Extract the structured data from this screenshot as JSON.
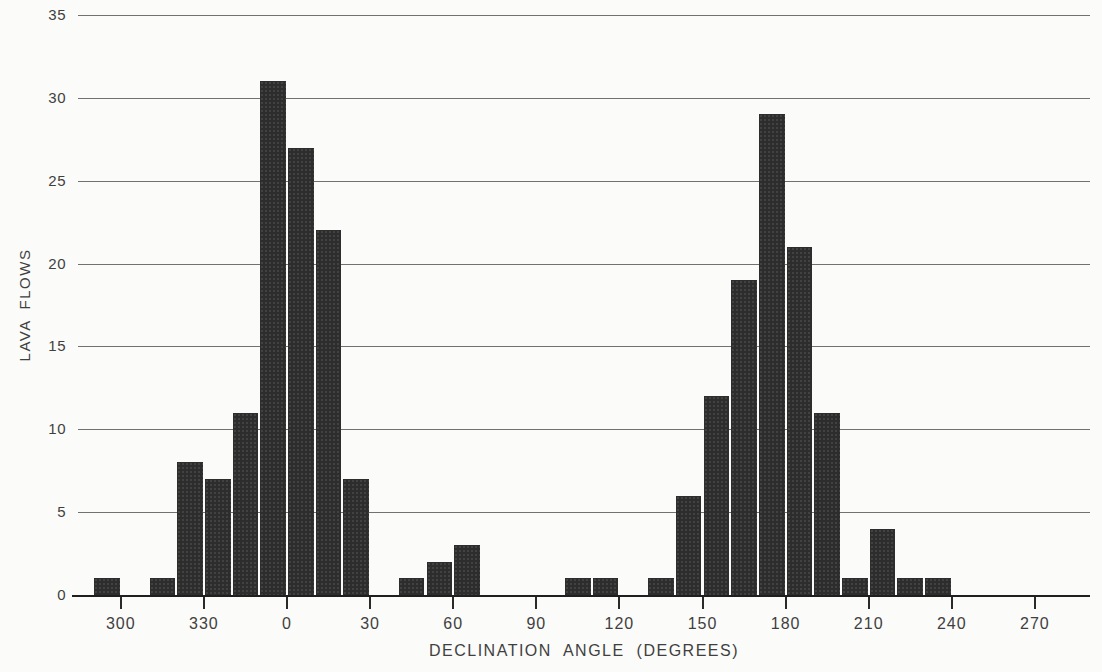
{
  "chart_data": {
    "type": "bar",
    "title": "",
    "xlabel": "DECLINATION ANGLE (DEGREES)",
    "ylabel": "LAVA FLOWS",
    "ylim": [
      0,
      35
    ],
    "y_ticks": [
      0,
      5,
      10,
      15,
      20,
      25,
      30,
      35
    ],
    "x_tick_labels": [
      "300",
      "330",
      "0",
      "30",
      "60",
      "90",
      "120",
      "150",
      "180",
      "210",
      "240",
      "270"
    ],
    "bin_width_deg": 10,
    "bins": [
      {
        "start_deg": 290,
        "count": 1
      },
      {
        "start_deg": 310,
        "count": 1
      },
      {
        "start_deg": 320,
        "count": 8
      },
      {
        "start_deg": 330,
        "count": 7
      },
      {
        "start_deg": 340,
        "count": 11
      },
      {
        "start_deg": 350,
        "count": 31
      },
      {
        "start_deg": 0,
        "count": 27
      },
      {
        "start_deg": 10,
        "count": 22
      },
      {
        "start_deg": 20,
        "count": 7
      },
      {
        "start_deg": 40,
        "count": 1
      },
      {
        "start_deg": 50,
        "count": 2
      },
      {
        "start_deg": 60,
        "count": 3
      },
      {
        "start_deg": 100,
        "count": 1
      },
      {
        "start_deg": 110,
        "count": 1
      },
      {
        "start_deg": 130,
        "count": 1
      },
      {
        "start_deg": 140,
        "count": 6
      },
      {
        "start_deg": 150,
        "count": 12
      },
      {
        "start_deg": 160,
        "count": 19
      },
      {
        "start_deg": 170,
        "count": 29
      },
      {
        "start_deg": 180,
        "count": 21
      },
      {
        "start_deg": 190,
        "count": 11
      },
      {
        "start_deg": 200,
        "count": 1
      },
      {
        "start_deg": 210,
        "count": 4
      },
      {
        "start_deg": 220,
        "count": 1
      },
      {
        "start_deg": 230,
        "count": 1
      }
    ],
    "grid": "horizontal",
    "legend": "none",
    "bar_color": "#2d2d2d",
    "background_color": "#fbfbf9",
    "axis_color": "#1f1f1f",
    "text_color": "#3f3f3f"
  }
}
